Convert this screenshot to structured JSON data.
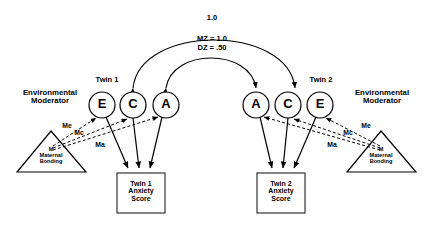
{
  "diagram": {
    "background": "#ffffff",
    "line_color": "#000000"
  },
  "arcs": [
    {
      "name": "c-correlation",
      "label": "1.0"
    },
    {
      "name": "a-correlation-mz",
      "label": "MZ = 1.0"
    },
    {
      "name": "a-correlation-dz",
      "label": "DZ = .50"
    }
  ],
  "twin1": {
    "header": "Twin 1",
    "nodes": [
      {
        "id": "e1",
        "letter": "E"
      },
      {
        "id": "c1",
        "letter": "C"
      },
      {
        "id": "a1",
        "letter": "A"
      }
    ],
    "outcome": "Twin 1\nAnxiety\nScore",
    "moderator": {
      "header": "Environmental\nModerator",
      "shape_label": "M\nMaternal\nBonding",
      "paths": [
        {
          "id": "me1",
          "label": "Me"
        },
        {
          "id": "mc1",
          "label": "Mc"
        },
        {
          "id": "ma1",
          "label": "Ma"
        }
      ]
    }
  },
  "twin2": {
    "header": "Twin 2",
    "nodes": [
      {
        "id": "a2",
        "letter": "A"
      },
      {
        "id": "c2",
        "letter": "C"
      },
      {
        "id": "e2",
        "letter": "E"
      }
    ],
    "outcome": "Twin 2\nAnxiety\nScore",
    "moderator": {
      "header": "Environmental\nModerator",
      "shape_label": "M\nMaternal\nBonding",
      "paths": [
        {
          "id": "mc2",
          "label": "Mc"
        },
        {
          "id": "me2",
          "label": "Me"
        },
        {
          "id": "ma2",
          "label": "Ma"
        }
      ]
    }
  }
}
